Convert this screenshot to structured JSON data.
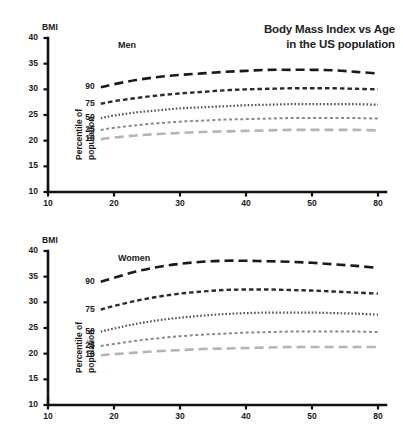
{
  "title": {
    "line1": "Body Mass Index vs Age",
    "line2": "in the US population"
  },
  "axis_name": "BMI",
  "percentile_axis_label_line1": "Percentile of",
  "percentile_axis_label_line2": "population",
  "panels": [
    {
      "label": "Men"
    },
    {
      "label": "Women"
    }
  ],
  "chart_data": {
    "type": "line",
    "title": "Body Mass Index vs Age in the US population",
    "xlabel": "",
    "ylabel": "BMI",
    "xlim": [
      10,
      85
    ],
    "ylim": [
      10,
      40
    ],
    "xticks": [
      10,
      20,
      30,
      40,
      50,
      80
    ],
    "yticks": [
      10,
      15,
      20,
      25,
      30,
      35,
      40
    ],
    "grid": false,
    "legend": "inline-left (percentile labels beside curve origins)",
    "legend_title": "Percentile of population",
    "panels": [
      {
        "name": "Men",
        "x": [
          22,
          25,
          30,
          35,
          40,
          45,
          50,
          55,
          60,
          65,
          70,
          75,
          80,
          85
        ],
        "series": [
          {
            "name": "90",
            "percentile": 90,
            "color": "#1a1a1a",
            "dash": "long-dash",
            "values": [
              30.4,
              31.0,
              31.8,
              32.4,
              32.8,
              33.1,
              33.4,
              33.6,
              33.8,
              33.8,
              33.8,
              33.7,
              33.4,
              33.1
            ]
          },
          {
            "name": "75",
            "percentile": 75,
            "color": "#2b2b2b",
            "dash": "medium-dash",
            "values": [
              27.2,
              27.7,
              28.3,
              28.8,
              29.2,
              29.5,
              29.8,
              30.0,
              30.1,
              30.2,
              30.2,
              30.2,
              30.1,
              30.0
            ]
          },
          {
            "name": "50",
            "percentile": 50,
            "color": "#555555",
            "dash": "dotted",
            "values": [
              24.4,
              24.9,
              25.5,
              25.9,
              26.3,
              26.5,
              26.7,
              26.9,
              27.0,
              27.1,
              27.1,
              27.1,
              27.1,
              27.0
            ]
          },
          {
            "name": "25",
            "percentile": 25,
            "color": "#8a8a8a",
            "dash": "fine-dash",
            "values": [
              22.1,
              22.5,
              23.0,
              23.4,
              23.7,
              23.9,
              24.1,
              24.2,
              24.3,
              24.4,
              24.4,
              24.4,
              24.4,
              24.3
            ]
          },
          {
            "name": "10",
            "percentile": 10,
            "color": "#b5b5b5",
            "dash": "long-dash",
            "values": [
              20.3,
              20.6,
              21.0,
              21.3,
              21.5,
              21.7,
              21.8,
              21.9,
              22.0,
              22.1,
              22.1,
              22.1,
              22.1,
              22.0
            ]
          }
        ]
      },
      {
        "name": "Women",
        "x": [
          22,
          25,
          30,
          35,
          40,
          45,
          50,
          55,
          60,
          65,
          70,
          75,
          80,
          85
        ],
        "series": [
          {
            "name": "90",
            "percentile": 90,
            "color": "#1a1a1a",
            "dash": "long-dash",
            "values": [
              34.0,
              34.8,
              36.0,
              36.9,
              37.5,
              37.9,
              38.1,
              38.1,
              38.0,
              37.9,
              37.7,
              37.4,
              37.1,
              36.7
            ]
          },
          {
            "name": "75",
            "percentile": 75,
            "color": "#2b2b2b",
            "dash": "medium-dash",
            "values": [
              28.6,
              29.3,
              30.3,
              31.1,
              31.7,
              32.1,
              32.4,
              32.5,
              32.5,
              32.4,
              32.3,
              32.1,
              31.9,
              31.7
            ]
          },
          {
            "name": "50",
            "percentile": 50,
            "color": "#555555",
            "dash": "dotted",
            "values": [
              24.3,
              24.9,
              25.8,
              26.5,
              27.0,
              27.4,
              27.7,
              27.9,
              28.0,
              28.0,
              28.0,
              27.9,
              27.8,
              27.6
            ]
          },
          {
            "name": "25",
            "percentile": 25,
            "color": "#8a8a8a",
            "dash": "fine-dash",
            "values": [
              21.5,
              21.9,
              22.5,
              23.0,
              23.4,
              23.7,
              23.9,
              24.1,
              24.2,
              24.3,
              24.3,
              24.3,
              24.3,
              24.2
            ]
          },
          {
            "name": "10",
            "percentile": 10,
            "color": "#b5b5b5",
            "dash": "long-dash",
            "values": [
              19.7,
              19.9,
              20.2,
              20.5,
              20.7,
              20.9,
              21.0,
              21.1,
              21.2,
              21.3,
              21.3,
              21.3,
              21.3,
              21.3
            ]
          }
        ]
      }
    ]
  }
}
